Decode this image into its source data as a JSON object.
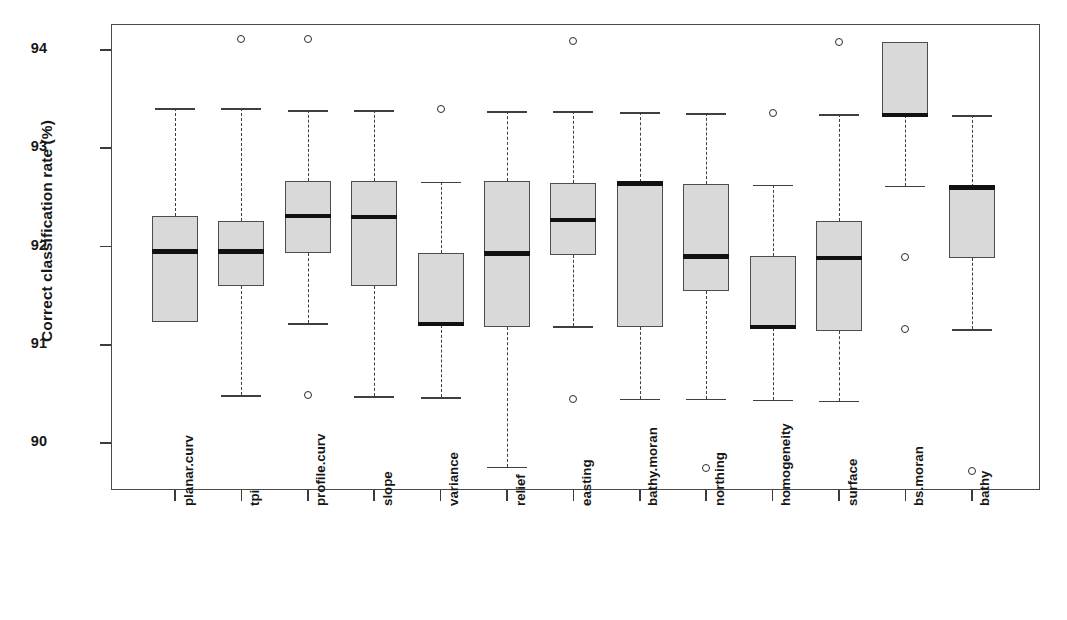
{
  "chart_data": {
    "type": "box",
    "title": "",
    "xlabel": "",
    "ylabel": "Correct classification rate (%)",
    "ylim": [
      89.5,
      94.35
    ],
    "yticks": [
      90,
      91,
      92,
      93,
      94
    ],
    "ytick_labels": [
      "90",
      "91",
      "92",
      "93",
      "94"
    ],
    "grid": false,
    "legend": "none",
    "orientation": "vertical",
    "categories": [
      "planar.curv",
      "tpi",
      "profile.curv",
      "slope",
      "variance",
      "relief",
      "easting",
      "bathy.moran",
      "northing",
      "homogeneity",
      "surface",
      "bs.moran",
      "bathy"
    ],
    "boxes": [
      {
        "name": "planar.curv",
        "whisker_low": 91.23,
        "q1": 91.23,
        "median": 91.95,
        "q3": 92.31,
        "whisker_high": 93.41,
        "outliers": []
      },
      {
        "name": "tpi",
        "whisker_low": 90.49,
        "q1": 91.6,
        "median": 91.95,
        "q3": 92.26,
        "whisker_high": 93.41,
        "outliers": [
          94.11
        ]
      },
      {
        "name": "profile.curv",
        "whisker_low": 91.22,
        "q1": 91.93,
        "median": 92.31,
        "q3": 92.67,
        "whisker_high": 93.39,
        "outliers": [
          94.11,
          90.49
        ]
      },
      {
        "name": "slope",
        "whisker_low": 90.48,
        "q1": 91.6,
        "median": 92.3,
        "q3": 92.67,
        "whisker_high": 93.39,
        "outliers": []
      },
      {
        "name": "variance",
        "whisker_low": 90.47,
        "q1": 91.2,
        "median": 91.21,
        "q3": 91.93,
        "whisker_high": 92.66,
        "outliers": [
          93.4
        ]
      },
      {
        "name": "relief",
        "whisker_low": 89.76,
        "q1": 91.18,
        "median": 91.93,
        "q3": 92.67,
        "whisker_high": 93.38,
        "outliers": []
      },
      {
        "name": "easting",
        "whisker_low": 91.19,
        "q1": 91.91,
        "median": 92.27,
        "q3": 92.65,
        "whisker_high": 93.38,
        "outliers": [
          94.09,
          90.45
        ]
      },
      {
        "name": "bathy.moran",
        "whisker_low": 90.45,
        "q1": 91.18,
        "median": 92.64,
        "q3": 92.66,
        "whisker_high": 93.37,
        "outliers": []
      },
      {
        "name": "northing",
        "whisker_low": 90.45,
        "q1": 91.55,
        "median": 91.9,
        "q3": 92.64,
        "whisker_high": 93.36,
        "outliers": [
          89.75
        ]
      },
      {
        "name": "homogeneity",
        "whisker_low": 90.44,
        "q1": 91.17,
        "median": 91.18,
        "q3": 91.9,
        "whisker_high": 92.63,
        "outliers": [
          93.36
        ]
      },
      {
        "name": "surface",
        "whisker_low": 90.43,
        "q1": 91.14,
        "median": 91.88,
        "q3": 92.26,
        "whisker_high": 93.35,
        "outliers": [
          94.08
        ]
      },
      {
        "name": "bs.moran",
        "whisker_low": 92.62,
        "q1": 93.34,
        "median": 93.34,
        "q3": 94.08,
        "whisker_high": 94.08,
        "outliers": [
          91.89,
          91.16
        ]
      },
      {
        "name": "bathy",
        "whisker_low": 91.16,
        "q1": 91.88,
        "median": 92.6,
        "q3": 92.61,
        "whisker_high": 93.34,
        "outliers": [
          89.72
        ]
      }
    ]
  },
  "style": {
    "box_fill": "#d9d9d9",
    "box_stroke": "#4d4d4d",
    "median_color": "#111111",
    "whisker_color": "#3f3f3f",
    "outlier_stroke": "#2b2b2b",
    "frame_color": "#4a4a4a",
    "background": "#ffffff"
  },
  "geometry": {
    "plot_left": 111,
    "plot_top": 24,
    "plot_width": 929,
    "plot_height": 466,
    "y_94_px": 50,
    "px_per_unit": 98.25,
    "x_first_px": 175,
    "x_spacing_px": 66.4,
    "box_width_px": 46
  }
}
